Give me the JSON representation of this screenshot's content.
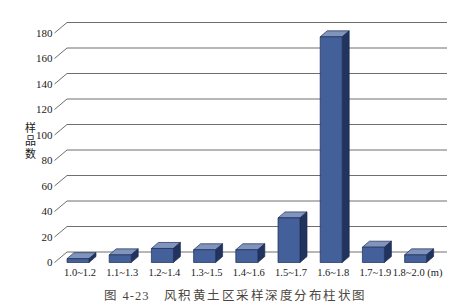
{
  "figure": {
    "caption_label": "图 4-23",
    "caption_text": "风积黄土区采样深度分布柱状图"
  },
  "chart_data": {
    "type": "bar",
    "style": "3d-column",
    "categories": [
      "1.0~1.2",
      "1.1~1.3",
      "1.2~1.4",
      "1.3~1.5",
      "1.4~1.6",
      "1.5~1.7",
      "1.6~1.8",
      "1.7~1.9",
      "1.8~2.0"
    ],
    "values": [
      3,
      6,
      11,
      10,
      10,
      35,
      177,
      12,
      6
    ],
    "x_unit": "(m)",
    "xlabel": "",
    "ylabel": "样品数",
    "ylim": [
      0,
      180
    ],
    "yticks": [
      0,
      20,
      40,
      60,
      80,
      100,
      120,
      140,
      160,
      180
    ],
    "grid": true,
    "legend": "none",
    "colors": {
      "bar_front": "#44609A",
      "bar_top": "#8094BD",
      "bar_side": "#20345F",
      "bar_outline": "#1C2C52",
      "gridline": "#6E6E6E",
      "tick_text": "#1A1A1A",
      "caption_text": "#4D4640",
      "background": "#FFFFFF"
    }
  }
}
